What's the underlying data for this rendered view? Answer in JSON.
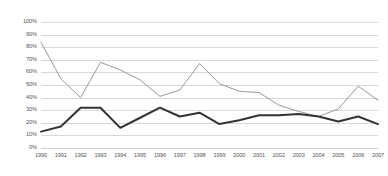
{
  "chart_data": {
    "type": "line",
    "title": "",
    "xlabel": "",
    "ylabel": "",
    "categories": [
      "1990",
      "1991",
      "1992",
      "1993",
      "1994",
      "1995",
      "1996",
      "1997",
      "1998",
      "1999",
      "2000",
      "2001",
      "2002",
      "2003",
      "2004",
      "2005",
      "2006",
      "2007"
    ],
    "ylim": [
      0,
      100
    ],
    "ytick_labels": [
      "100%",
      "90%",
      "80%",
      "70%",
      "60%",
      "50%",
      "40%",
      "30%",
      "20%",
      "10%",
      "0%"
    ],
    "ytick_values": [
      100,
      90,
      80,
      70,
      60,
      50,
      40,
      30,
      20,
      10,
      0
    ],
    "grid": "horizontal",
    "legend": "none",
    "series": [
      {
        "name": "series-gray",
        "color": "#999999",
        "width": 1,
        "values": [
          84,
          55,
          40,
          68,
          62,
          54,
          41,
          46,
          67,
          51,
          45,
          44,
          34,
          29,
          25,
          31,
          49,
          38
        ]
      },
      {
        "name": "series-dark",
        "color": "#333333",
        "width": 2,
        "values": [
          13,
          17,
          32,
          32,
          16,
          24,
          32,
          25,
          28,
          19,
          22,
          26,
          26,
          27,
          25,
          21,
          25,
          19
        ]
      }
    ]
  }
}
